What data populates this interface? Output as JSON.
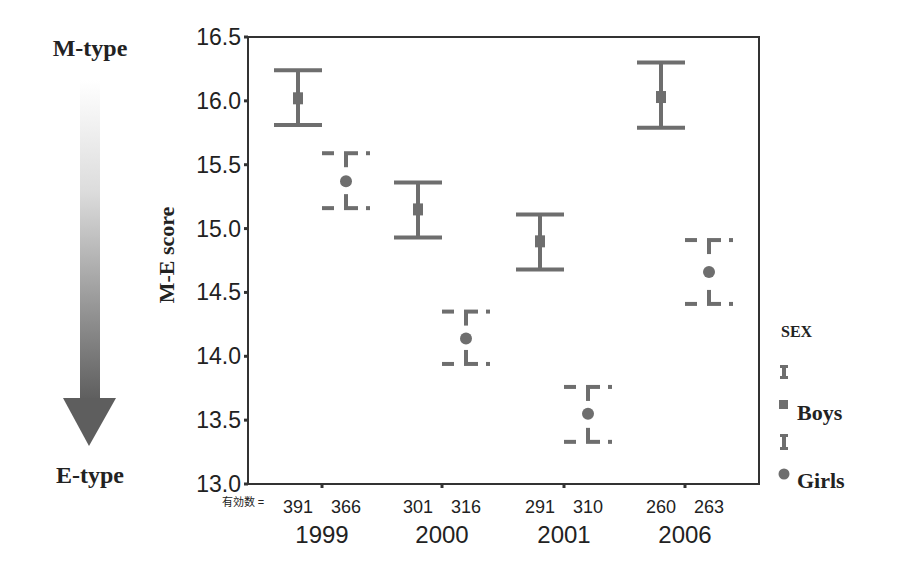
{
  "chart_data": {
    "type": "errorbar",
    "title": "",
    "ylabel": "M-E score",
    "xlabel": "",
    "ylim": [
      13.0,
      16.5
    ],
    "yticks": [
      "13.0",
      "13.5",
      "14.0",
      "14.5",
      "15.0",
      "15.5",
      "16.0",
      "16.5"
    ],
    "categories": [
      "1999",
      "2000",
      "2001",
      "2006"
    ],
    "n_label": "有効数 =",
    "n_values": [
      [
        "391",
        "366"
      ],
      [
        "301",
        "316"
      ],
      [
        "291",
        "310"
      ],
      [
        "260",
        "263"
      ]
    ],
    "series": [
      {
        "name": "Boys",
        "marker": "square",
        "line_style": "solid",
        "mean": [
          16.02,
          15.15,
          14.9,
          16.03
        ],
        "upper": [
          16.24,
          15.36,
          15.11,
          16.3
        ],
        "lower": [
          15.81,
          14.93,
          14.68,
          15.79
        ]
      },
      {
        "name": "Girls",
        "marker": "circle",
        "line_style": "dashed",
        "mean": [
          15.37,
          14.14,
          13.55,
          14.66
        ],
        "upper": [
          15.59,
          14.35,
          13.76,
          14.91
        ],
        "lower": [
          15.16,
          13.94,
          13.33,
          14.41
        ]
      }
    ],
    "legend": {
      "title": "SEX",
      "position": "right",
      "entries": [
        "Boys",
        "Girls"
      ]
    },
    "annotations": {
      "top_label": "M-type",
      "bottom_label": "E-type",
      "arrow": "down gradient arrow from M-type to E-type"
    },
    "grid": false
  },
  "colors": {
    "series": "#6e6e6e",
    "axis": "#333333",
    "arrow_start": "#ffffff",
    "arrow_end": "#5e5e5e",
    "text": "#222222"
  }
}
